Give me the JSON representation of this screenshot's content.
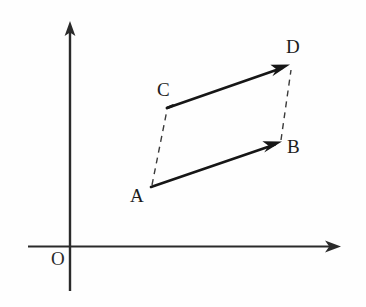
{
  "figure": {
    "type": "geometry-diagram",
    "background_color": "#fefefe",
    "stroke_color": "#1c1c1c",
    "axis_color": "#2a2a2a",
    "dashed_color": "#3a3a3a"
  },
  "axes": {
    "origin_label": "O",
    "origin_label_position": {
      "x": 52,
      "y": 250
    },
    "origin_point": {
      "x": 70,
      "y": 246
    },
    "y_axis": {
      "x": 70,
      "y_top": 22,
      "y_bottom": 291,
      "arrow": "up"
    },
    "x_axis": {
      "y": 246,
      "x_left": 28,
      "x_right": 341,
      "arrow": "right"
    }
  },
  "points": [
    {
      "name": "A",
      "label": "A",
      "x": 151,
      "y": 187,
      "label_x": 130,
      "label_y": 188
    },
    {
      "name": "B",
      "label": "B",
      "x": 281,
      "y": 142,
      "label_x": 287,
      "label_y": 139
    },
    {
      "name": "C",
      "label": "C",
      "x": 167,
      "y": 108,
      "label_x": 157,
      "label_y": 81
    },
    {
      "name": "D",
      "label": "D",
      "x": 289,
      "y": 65,
      "label_x": 287,
      "label_y": 38
    }
  ],
  "vectors": [
    {
      "name": "vector-ab",
      "from": "A",
      "to": "B",
      "style": "solid",
      "arrow": true
    },
    {
      "name": "vector-cd",
      "from": "C",
      "to": "D",
      "style": "solid",
      "arrow": true
    }
  ],
  "dashed_segments": [
    {
      "name": "segment-ac",
      "from": "A",
      "to": "C",
      "style": "dashed"
    },
    {
      "name": "segment-bd",
      "from": "B",
      "to": "D",
      "style": "dashed"
    }
  ],
  "labels": {
    "a": "A",
    "b": "B",
    "c": "C",
    "d": "D",
    "origin": "O"
  }
}
